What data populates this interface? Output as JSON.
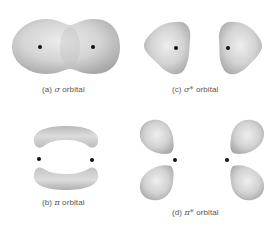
{
  "figure": {
    "panels": [
      {
        "id": "a",
        "prefix": "(a)",
        "symbol": "σ",
        "suffix": "orbital",
        "caption": "(a) σ orbital",
        "shape": "single elongated peanut-shaped lobe enclosing both nuclei"
      },
      {
        "id": "b",
        "prefix": "(b)",
        "symbol": "π",
        "suffix": "orbital",
        "caption": "(b) π orbital",
        "shape": "two curved banana-shaped lobes above and below the internuclear axis"
      },
      {
        "id": "c",
        "prefix": "(c)",
        "symbol": "σ*",
        "suffix": "orbital",
        "caption": "(c) σ* orbital",
        "shape": "two separate lobes pointing away from each other, one around each nucleus"
      },
      {
        "id": "d",
        "prefix": "(d)",
        "symbol": "π*",
        "suffix": "orbital",
        "caption": "(d) π* orbital",
        "shape": "four teardrop lobes, two at each nucleus, splayed outward"
      }
    ],
    "nucleus_count_per_panel": 2
  },
  "colors": {
    "background": "#ffffff",
    "lobe_light": "#e6e6e6",
    "lobe_mid": "#c8c8c8",
    "lobe_dark": "#a9a9a9",
    "nucleus": "#111111",
    "caption": "#555555"
  }
}
